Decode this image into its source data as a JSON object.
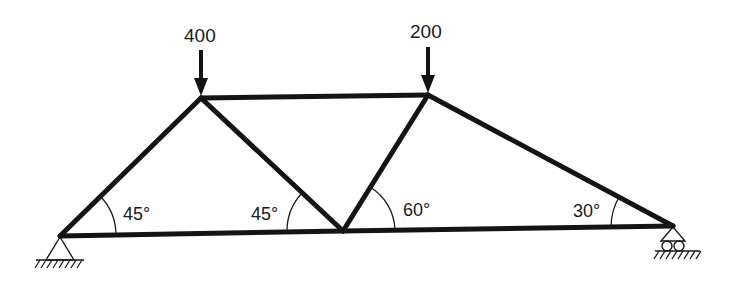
{
  "diagram": {
    "type": "truss",
    "colors": {
      "line": "#141414",
      "background": "#ffffff"
    },
    "nodes": {
      "A": {
        "x": 60,
        "y": 236,
        "support": "pin"
      },
      "B": {
        "x": 201,
        "y": 98
      },
      "C": {
        "x": 343,
        "y": 231
      },
      "D": {
        "x": 428,
        "y": 95
      },
      "E": {
        "x": 673,
        "y": 226,
        "support": "roller"
      }
    },
    "members": [
      [
        "A",
        "B"
      ],
      [
        "B",
        "D"
      ],
      [
        "B",
        "C"
      ],
      [
        "C",
        "D"
      ],
      [
        "D",
        "E"
      ],
      [
        "A",
        "C"
      ],
      [
        "C",
        "E"
      ]
    ],
    "loads": [
      {
        "node": "B",
        "label": "400",
        "direction": "down"
      },
      {
        "node": "D",
        "label": "200",
        "direction": "down"
      }
    ],
    "angles": [
      {
        "at": "A",
        "label": "45°",
        "between": "AB-AC"
      },
      {
        "at": "C",
        "label": "45°",
        "between": "CB-CA"
      },
      {
        "at": "C",
        "label": "60°",
        "between": "CD-CE"
      },
      {
        "at": "E",
        "label": "30°",
        "between": "ED-EC"
      }
    ],
    "supports": [
      {
        "node": "A",
        "type": "pin-icon"
      },
      {
        "node": "E",
        "type": "roller-icon"
      }
    ]
  }
}
